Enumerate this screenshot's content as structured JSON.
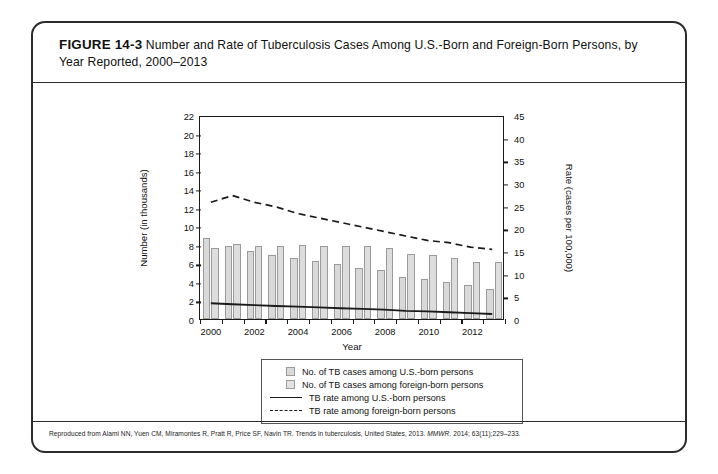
{
  "figure": {
    "number": "FIGURE 14-3",
    "title": "Number and Rate of Tuberculosis Cases Among U.S.-Born and Foreign-Born Persons, by Year Reported, 2000–2013",
    "credit_prefix": "Reproduced from Alami NN, Yuen CM, Miramontes R, Pratt R, Price SF, Navin TR. Trends in tuberculosis, United States, 2013. ",
    "credit_journal": "MMWR.",
    "credit_suffix": " 2014; 63(11);229–233."
  },
  "legend": {
    "items": [
      {
        "label": "No. of TB cases among U.S.-born persons",
        "marker": "swatch-usborn"
      },
      {
        "label": "No. of TB cases among foreign-born persons",
        "marker": "swatch-foreignborn"
      },
      {
        "label": "TB rate among U.S.-born persons",
        "marker": "solid-line"
      },
      {
        "label": "TB rate among foreign-born persons",
        "marker": "dashed-line"
      }
    ]
  },
  "chart_data": {
    "type": "bar",
    "title": "Number and Rate of Tuberculosis Cases Among U.S.-Born and Foreign-Born Persons, by Year Reported, 2000–2013",
    "xlabel": "Year",
    "ylabel": "Number (in thousands)",
    "y2label": "Rate (cases per 100,000)",
    "ylim": [
      0,
      22
    ],
    "y2lim": [
      0,
      45
    ],
    "yticks": [
      0,
      2,
      4,
      6,
      8,
      10,
      12,
      14,
      16,
      18,
      20,
      22
    ],
    "y2ticks": [
      0,
      5,
      10,
      15,
      20,
      25,
      30,
      35,
      40,
      45
    ],
    "grid": false,
    "legend_position": "below-plot",
    "categories": [
      2000,
      2001,
      2002,
      2003,
      2004,
      2005,
      2006,
      2007,
      2008,
      2009,
      2010,
      2011,
      2012,
      2013
    ],
    "xtick_labels": [
      "2000",
      "2002",
      "2004",
      "2006",
      "2008",
      "2010",
      "2012"
    ],
    "series": [
      {
        "name": "No. of TB cases among U.S.-born persons",
        "axis": "left",
        "kind": "bar",
        "unit": "thousands",
        "values": [
          8.7,
          7.9,
          7.3,
          6.9,
          6.6,
          6.3,
          5.9,
          5.5,
          5.25,
          4.5,
          4.35,
          4.0,
          3.65,
          3.2
        ]
      },
      {
        "name": "No. of TB cases among foreign-born persons",
        "axis": "left",
        "kind": "bar",
        "unit": "thousands",
        "values": [
          7.65,
          8.1,
          7.85,
          7.9,
          7.95,
          7.9,
          7.9,
          7.9,
          7.65,
          7.0,
          6.85,
          6.55,
          6.15,
          6.1
        ]
      },
      {
        "name": "TB rate among U.S.-born persons",
        "axis": "right",
        "kind": "line",
        "style": "solid",
        "unit": "cases per 100,000",
        "values": [
          3.5,
          3.3,
          3.1,
          2.9,
          2.75,
          2.6,
          2.4,
          2.25,
          2.1,
          1.8,
          1.7,
          1.5,
          1.3,
          1.1
        ]
      },
      {
        "name": "TB rate among foreign-born persons",
        "axis": "right",
        "kind": "line",
        "style": "dashed",
        "unit": "cases per 100,000",
        "values": [
          26.0,
          27.5,
          26.0,
          25.0,
          23.5,
          22.5,
          21.5,
          20.5,
          19.5,
          18.5,
          17.5,
          17.0,
          16.0,
          15.5
        ]
      }
    ]
  },
  "colors": {
    "bar_usborn_fill": "#d9d9d9",
    "bar_foreignborn_fill": "#dddddd",
    "bar_stroke": "#9a9a9a",
    "line": "#1a1a1a",
    "axis": "#1a1a1a",
    "card_border": "#2b2b2b"
  }
}
